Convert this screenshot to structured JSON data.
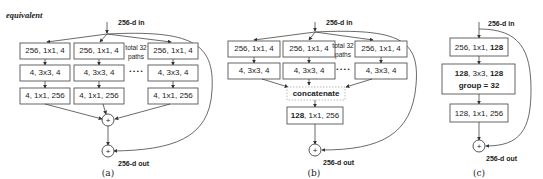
{
  "header": {
    "equivalent_label": "equivalent"
  },
  "panel_a": {
    "caption": "(a)",
    "input_label": "256-d in",
    "output_label": "256-d out",
    "paths_note_line1": "total 32",
    "paths_note_line2": "paths",
    "ellipsis": "• • • •",
    "columns": [
      {
        "layers": [
          "256, 1x1, 4",
          "4, 3x3, 4",
          "4, 1x1, 256"
        ]
      },
      {
        "layers": [
          "256, 1x1, 4",
          "4, 3x3, 4",
          "4, 1x1, 256"
        ]
      },
      {
        "layers": [
          "256, 1x1, 4",
          "4, 3x3, 4",
          "4, 1x1, 256"
        ]
      }
    ],
    "sum_symbol": "+",
    "residual_symbol": "+"
  },
  "panel_b": {
    "caption": "(b)",
    "input_label": "256-d in",
    "output_label": "256-d out",
    "paths_note_line1": "total 32",
    "paths_note_line2": "paths",
    "ellipsis": "• • • •",
    "columns": [
      {
        "layers": [
          "256, 1x1, 4",
          "4, 3x3, 4"
        ]
      },
      {
        "layers": [
          "256, 1x1, 4",
          "4, 3x3, 4"
        ]
      },
      {
        "layers": [
          "256, 1x1, 4",
          "4, 3x3, 4"
        ]
      }
    ],
    "concat_label": "concatenate",
    "final_layer": {
      "bold": "128",
      "rest": ", 1x1, 256"
    },
    "residual_symbol": "+"
  },
  "panel_c": {
    "caption": "(c)",
    "input_label": "256-d in",
    "output_label": "256-d out",
    "layer1": {
      "rest": "256, 1x1, ",
      "bold": "128"
    },
    "layer2": {
      "b1": "128",
      "mid": ", 3x3, ",
      "b2": "128",
      "line2": "group = 32"
    },
    "layer3": "128, 1x1, 256",
    "residual_symbol": "+"
  }
}
